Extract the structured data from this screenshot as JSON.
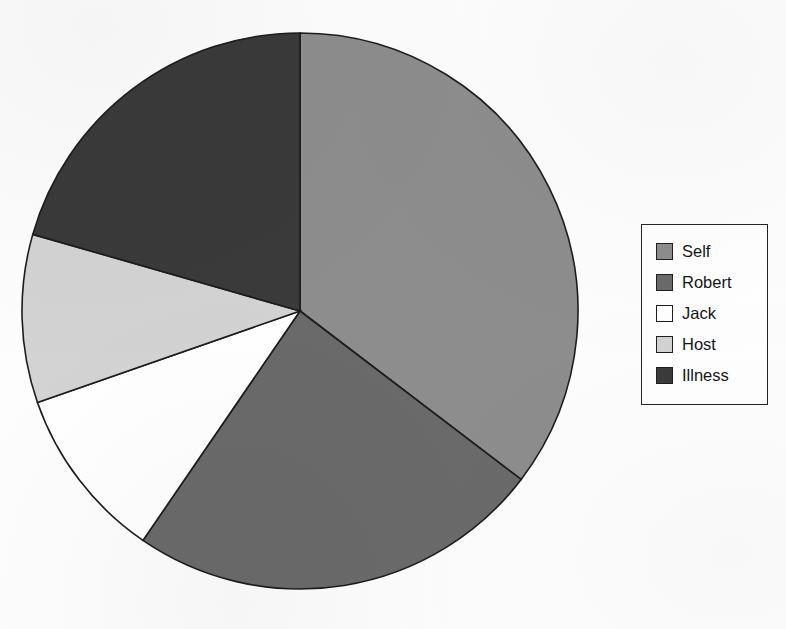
{
  "figure": {
    "background_color": "#fdfdfd",
    "top_edge_ghost_text": "",
    "outline_color": "#1c1c1c"
  },
  "legend": {
    "position": "right",
    "border_color": "#242424",
    "background_color": "#ffffff",
    "items": [
      {
        "label": "Self",
        "color": "#8d8d8d"
      },
      {
        "label": "Robert",
        "color": "#6a6a6a"
      },
      {
        "label": "Jack",
        "color": "#ffffff"
      },
      {
        "label": "Host",
        "color": "#d3d3d3"
      },
      {
        "label": "Illness",
        "color": "#3a3a3a"
      }
    ]
  },
  "chart_data": {
    "type": "pie",
    "title": "",
    "xlabel": "",
    "ylabel": "",
    "legend_position": "right",
    "grid": false,
    "start_angle_deg": 0,
    "direction": "clockwise",
    "center": {
      "x": 300,
      "y": 311
    },
    "radius": 278,
    "categories": [
      "Self",
      "Robert",
      "Jack",
      "Host",
      "Illness"
    ],
    "values": [
      35.4,
      24.2,
      10.1,
      9.8,
      20.6
    ],
    "colors": [
      "#8d8d8d",
      "#6a6a6a",
      "#ffffff",
      "#d3d3d3",
      "#3a3a3a"
    ],
    "slice_angles_deg": [
      {
        "name": "Self",
        "start": 0.0,
        "end": 127.3,
        "sweep": 127.3
      },
      {
        "name": "Robert",
        "start": 127.3,
        "end": 214.4,
        "sweep": 87.1
      },
      {
        "name": "Jack",
        "start": 214.4,
        "end": 250.8,
        "sweep": 36.4
      },
      {
        "name": "Host",
        "start": 250.8,
        "end": 286.0,
        "sweep": 35.2
      },
      {
        "name": "Illness",
        "start": 286.0,
        "end": 360.0,
        "sweep": 74.0
      }
    ]
  }
}
